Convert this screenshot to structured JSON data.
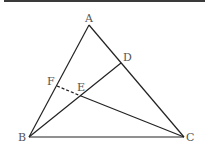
{
  "diagram": {
    "type": "geometry",
    "points": {
      "A": {
        "label": "A",
        "x": 89,
        "y": 25
      },
      "B": {
        "label": "B",
        "x": 29,
        "y": 137
      },
      "C": {
        "label": "C",
        "x": 184,
        "y": 137
      },
      "D": {
        "label": "D",
        "x": 121,
        "y": 63
      },
      "E": {
        "label": "E",
        "x": 81,
        "y": 96
      },
      "F": {
        "label": "F",
        "x": 57,
        "y": 86
      }
    },
    "segments": [
      {
        "from": "A",
        "to": "B",
        "style": "solid"
      },
      {
        "from": "A",
        "to": "C",
        "style": "solid"
      },
      {
        "from": "B",
        "to": "C",
        "style": "solid"
      },
      {
        "from": "B",
        "to": "D",
        "style": "solid"
      },
      {
        "from": "E",
        "to": "C",
        "style": "solid"
      },
      {
        "from": "F",
        "to": "E",
        "style": "dashed"
      }
    ],
    "colors": {
      "line": "#222222",
      "label": "#555555",
      "border": "#3a3a3a"
    }
  }
}
